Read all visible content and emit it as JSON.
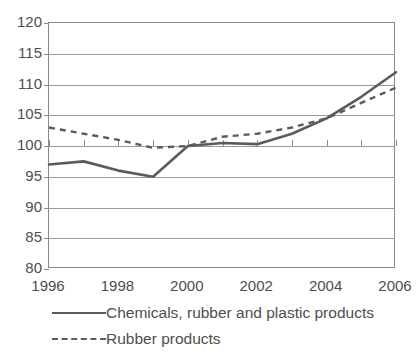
{
  "chart_data": {
    "type": "line",
    "title": "",
    "subtitle": "",
    "xlabel": "",
    "ylabel": "",
    "x": [
      1996,
      1997,
      1998,
      1999,
      2000,
      2001,
      2002,
      2003,
      2004,
      2005,
      2006
    ],
    "xtick_labels": [
      "1996",
      "1998",
      "2000",
      "2002",
      "2004",
      "2006"
    ],
    "xtick_values": [
      1996,
      1998,
      2000,
      2002,
      2004,
      2006
    ],
    "xlim": [
      1996,
      2006
    ],
    "ylim": [
      80,
      120
    ],
    "ytick_labels": [
      "80",
      "85",
      "90",
      "95",
      "100",
      "105",
      "110",
      "115",
      "120"
    ],
    "ytick_values": [
      80,
      85,
      90,
      95,
      100,
      105,
      110,
      115,
      120
    ],
    "grid": true,
    "legend_position": "bottom-left",
    "series": [
      {
        "name": "Chemicals, rubber and plastic products",
        "style": "solid",
        "color": "#5b5b5b",
        "values": [
          97.0,
          97.5,
          96.0,
          95.0,
          100.0,
          100.5,
          100.3,
          102.0,
          104.5,
          108.0,
          112.0
        ]
      },
      {
        "name": "Rubber products",
        "style": "dashed",
        "color": "#5b5b5b",
        "values": [
          103.0,
          102.0,
          101.0,
          99.7,
          100.0,
          101.5,
          102.0,
          103.0,
          104.5,
          107.0,
          109.5
        ]
      }
    ]
  },
  "legend": {
    "items": [
      {
        "label": "Chemicals, rubber and plastic products",
        "style": "solid"
      },
      {
        "label": "Rubber products",
        "style": "dashed"
      }
    ]
  }
}
